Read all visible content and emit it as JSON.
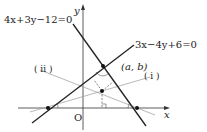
{
  "diagram": {
    "axes": {
      "x_label": "x",
      "y_label": "y",
      "origin_label": "O"
    },
    "lines": [
      {
        "id": "line1",
        "equation": "4x+3y−12=0"
      },
      {
        "id": "line2",
        "equation": "3x−4y+6=0"
      }
    ],
    "point_label": "(a, b)",
    "bisector_labels": [
      "( i )",
      "( ii )"
    ],
    "colors": {
      "main_line": "#222222",
      "bisector": "#999999",
      "axis": "#333333"
    }
  }
}
